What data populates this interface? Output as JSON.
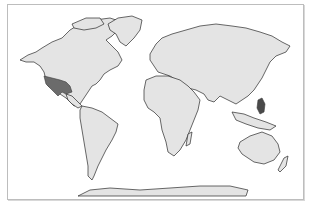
{
  "map": {
    "type": "choropleth-world",
    "projection": "equirectangular-like",
    "colors": {
      "land": "#e4e4e4",
      "highlight": "#6b6b6b",
      "border": "#2a2a2a",
      "frame": "#bdbdbd",
      "ocean": "#ffffff"
    },
    "highlighted_regions": [
      {
        "name": "Southwestern United States & Mexico",
        "color": "#6b6b6b"
      },
      {
        "name": "Philippines",
        "color": "#4a4a4a"
      }
    ]
  }
}
